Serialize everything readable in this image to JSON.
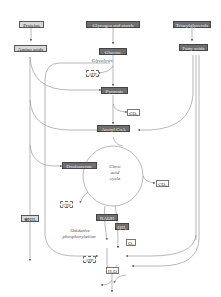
{
  "diagram": {
    "type": "metabolic-pathway",
    "title": "",
    "sources": {
      "proteins": "Proteins",
      "glycogen": "Glycogen and starch",
      "triacylglycerols": "Triacylglycerols"
    },
    "intermediates": {
      "amino_acids": "Amino acids",
      "glucose": "Glucose",
      "fatty_acids": "Fatty acids",
      "pyruvate": "Pyruvate",
      "acetyl_coa": "Acetyl CoA",
      "oxaloacetate": "Oxaloacetate",
      "nadh": "NADH",
      "qh2": "QH₂"
    },
    "products": {
      "atp_glycolysis": "ATP",
      "co2_pyruvate": "CO₂",
      "co2_cycle": "CO₂",
      "gtp": "GTP",
      "nh4": "⊕NH₄",
      "o2": "O₂",
      "atp_oxphos": "ATP",
      "h2o": "H₂O"
    },
    "process_labels": {
      "glycolysis": "Glycolysis",
      "citric_acid_cycle_1": "Citric",
      "citric_acid_cycle_2": "acid",
      "citric_acid_cycle_3": "cycle",
      "oxidative_1": "Oxidative",
      "oxidative_2": "phosphorylation"
    },
    "colors": {
      "light_box": "#d9d9d9",
      "dark_box": "#6e6e6e",
      "line": "#888888"
    }
  }
}
